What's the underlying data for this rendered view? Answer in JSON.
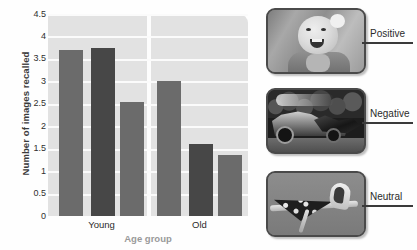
{
  "chart_data": {
    "type": "bar",
    "title": "",
    "xlabel": "Age group",
    "ylabel": "Number of images recalled",
    "categories": [
      "Young",
      "Old"
    ],
    "series": [
      {
        "name": "Positive",
        "values": [
          3.7,
          3.0
        ],
        "color": "#6b6b6b"
      },
      {
        "name": "Negative",
        "values": [
          3.75,
          1.6
        ],
        "color": "#474747"
      },
      {
        "name": "Neutral",
        "values": [
          2.55,
          1.35
        ],
        "color": "#6b6b6b"
      }
    ],
    "ylim": [
      0,
      4.5
    ],
    "yticks": [
      "4.5",
      "4",
      "3.5",
      "3",
      "2.5",
      "2",
      "1.5",
      "1",
      "0.5",
      "0"
    ],
    "ytick_values": [
      4.5,
      4,
      3.5,
      3,
      2.5,
      2,
      1.5,
      1,
      0.5,
      0
    ],
    "grid": true,
    "legend_position": "none",
    "plot_background": "#e2e2e2",
    "gridline_color": "#fbfbfb"
  },
  "chart": {
    "y_axis_title": "Number of images recalled",
    "x_axis_title": "Age group",
    "x_labels": [
      "Young",
      "Old"
    ],
    "y_labels": [
      "4.5",
      "4",
      "3.5",
      "3",
      "2.5",
      "2",
      "1.5",
      "1",
      "0.5",
      "0"
    ]
  },
  "photos": [
    {
      "label": "Positive",
      "icon": "baby-photo",
      "description": "smiling baby"
    },
    {
      "label": "Negative",
      "icon": "car-crash-photo",
      "description": "wrecked car"
    },
    {
      "label": "Neutral",
      "icon": "ironing-photo",
      "description": "iron on ironing board"
    }
  ]
}
